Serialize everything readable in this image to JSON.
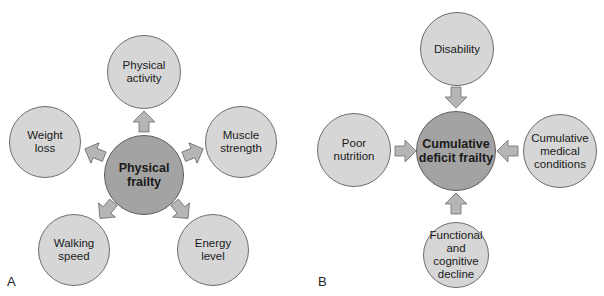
{
  "panels": {
    "a": {
      "label": "A",
      "center": "Physical frailty",
      "nodes": {
        "top": "Physical activity",
        "left": "Weight loss",
        "right": "Muscle strength",
        "bottom_left": "Walking speed",
        "bottom_right": "Energy level"
      },
      "arrow_direction": "outward"
    },
    "b": {
      "label": "B",
      "center": "Cumulative deficit frailty",
      "nodes": {
        "top": "Disability",
        "left": "Poor nutrition",
        "right": "Cumulative medical conditions",
        "bottom": "Functional and cognitive decline"
      },
      "arrow_direction": "inward"
    }
  },
  "colors": {
    "outer_fill": "#d6d6d6",
    "center_fill": "#a3a3a3",
    "arrow_fill": "#b5b5b5",
    "stroke": "#6d6d6d"
  }
}
